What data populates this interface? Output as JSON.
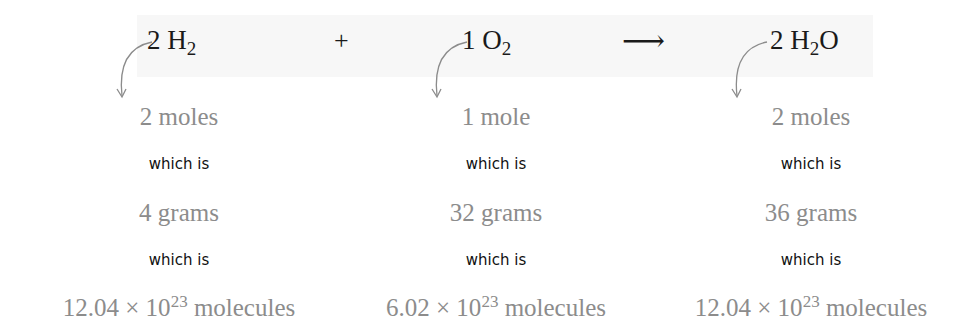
{
  "equation": {
    "reactant1": {
      "coef": "2",
      "element": "H",
      "sub": "2",
      "tail": ""
    },
    "plus": "+",
    "reactant2": {
      "coef": "1",
      "element": "O",
      "sub": "2",
      "tail": ""
    },
    "arrow": "⟶",
    "product": {
      "coef": "2",
      "element": "H",
      "sub": "2",
      "tail": "O"
    }
  },
  "columns": [
    {
      "moles": "2 moles",
      "which1": "which is",
      "grams": "4 grams",
      "which2": "which is",
      "molecules": {
        "mantissa": "12.04 × 10",
        "exponent": "23",
        "unit": " molecules"
      }
    },
    {
      "moles": "1 mole",
      "which1": "which is",
      "grams": "32 grams",
      "which2": "which is",
      "molecules": {
        "mantissa": "6.02 × 10",
        "exponent": "23",
        "unit": " molecules"
      }
    },
    {
      "moles": "2 moles",
      "which1": "which is",
      "grams": "36 grams",
      "which2": "which is",
      "molecules": {
        "mantissa": "12.04 × 10",
        "exponent": "23",
        "unit": " molecules"
      }
    }
  ],
  "colors": {
    "equation_text": "#1a1a1a",
    "quantity_text": "#8c8c8c",
    "connector_text": "#111111",
    "band_background": "#f7f7f7",
    "curve_arrow": "#8c8c8c"
  }
}
